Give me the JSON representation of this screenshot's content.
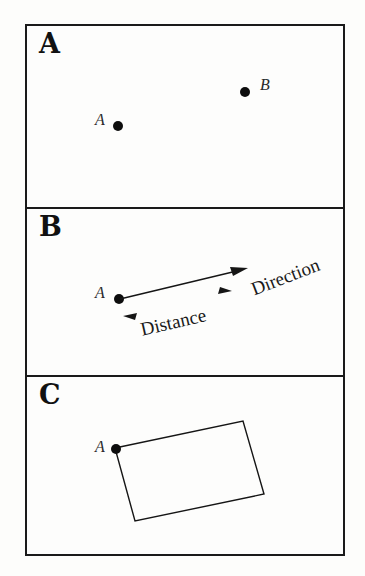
{
  "figure": {
    "background_color": "#fdfdfb",
    "ink_color": "#151515",
    "panel_count": 3
  },
  "panels": [
    {
      "label": "A",
      "name": "panel-point-location",
      "description": "Two labelled point locations A and B",
      "points": [
        {
          "label": "A",
          "x": 116,
          "y": 125,
          "label_x": 94,
          "label_y": 117
        },
        {
          "label": "B",
          "x": 243,
          "y": 91,
          "label_x": 259,
          "label_y": 82
        }
      ]
    },
    {
      "label": "B",
      "name": "panel-distance-direction",
      "description": "Vector from point A showing distance and direction",
      "points": [
        {
          "label": "A",
          "x": 117,
          "y": 300,
          "label_x": 95,
          "label_y": 292
        }
      ],
      "annotations": [
        {
          "text": "Direction",
          "x": 250,
          "y": 262,
          "rotation": -21
        },
        {
          "text": "Distance",
          "x": 139,
          "y": 311,
          "rotation": -13
        }
      ],
      "arrow": {
        "start_x": 120,
        "start_y": 299,
        "end_x": 246,
        "end_y": 268
      },
      "distance_markers": [
        {
          "name": "left-marker",
          "x": 126,
          "y": 313,
          "direction": "left"
        },
        {
          "name": "right-marker",
          "x": 228,
          "y": 293,
          "direction": "right"
        }
      ]
    },
    {
      "label": "C",
      "name": "panel-area-extent",
      "description": "Rotated rectangle anchored at point A",
      "points": [
        {
          "label": "A",
          "x": 116,
          "y": 445,
          "label_x": 94,
          "label_y": 437
        }
      ],
      "rectangle": {
        "corners": [
          {
            "x": 115,
            "y": 444
          },
          {
            "x": 243,
            "y": 417
          },
          {
            "x": 264,
            "y": 490
          },
          {
            "x": 135,
            "y": 517
          }
        ]
      }
    }
  ]
}
